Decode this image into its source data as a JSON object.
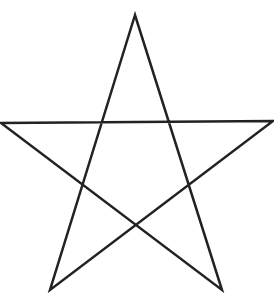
{
  "diagram": {
    "shape": "pentagram",
    "stroke_color": "#222222",
    "background_color": "#ffffff",
    "stroke_width": 2.5,
    "vertices": {
      "top": [
        135,
        15
      ],
      "left": [
        1,
        123
      ],
      "right": [
        273,
        121
      ],
      "bottom_left": [
        50,
        290
      ],
      "bottom_right": [
        222,
        290
      ]
    },
    "draw_order": [
      "top",
      "bottom_left",
      "right",
      "left",
      "bottom_right",
      "top"
    ]
  }
}
